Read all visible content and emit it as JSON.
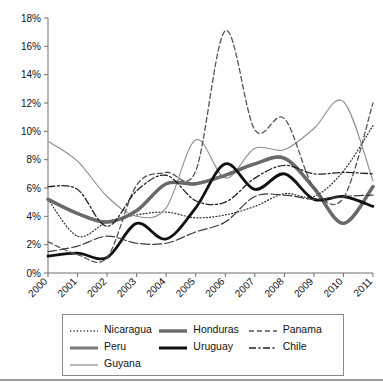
{
  "chart_data": {
    "type": "line",
    "title": "",
    "subtitle": "",
    "xlabel": "",
    "ylabel": "",
    "x": [
      2000,
      2001,
      2002,
      2003,
      2004,
      2005,
      2006,
      2007,
      2008,
      2009,
      2010,
      2011
    ],
    "categories": [
      "2000",
      "2001",
      "2002",
      "2003",
      "2004",
      "2005",
      "2006",
      "2007",
      "2008",
      "2009",
      "2010",
      "2011"
    ],
    "xlim": [
      2000,
      2011
    ],
    "ylim": [
      0,
      18
    ],
    "ytick_values": [
      0,
      2,
      4,
      6,
      8,
      10,
      12,
      14,
      16,
      18
    ],
    "ytick_labels": [
      "0%",
      "2%",
      "4%",
      "6%",
      "8%",
      "10%",
      "12%",
      "14%",
      "16%",
      "18%"
    ],
    "grid": false,
    "legend_position": "bottom",
    "value_unit": "percent",
    "series": [
      {
        "name": "Nicaragua",
        "style": "dotted",
        "color": "#2b2b2b",
        "width": 1.2,
        "dash": "1,2.2",
        "values": [
          5.2,
          2.6,
          3.6,
          4.1,
          4.3,
          3.9,
          4.1,
          4.7,
          5.6,
          5.4,
          7.2,
          10.4
        ]
      },
      {
        "name": "Peru",
        "style": "solid",
        "color": "#7a7a7a",
        "width": 3.0,
        "dash": "",
        "values": [
          5.2,
          4.2,
          3.6,
          4.4,
          6.3,
          6.3,
          6.9,
          7.7,
          8.1,
          6.0,
          3.5,
          6.1
        ]
      },
      {
        "name": "Guyana",
        "style": "solid",
        "color": "#8d8d8d",
        "width": 1.1,
        "dash": "",
        "values": [
          9.3,
          7.9,
          5.4,
          4.0,
          4.6,
          9.4,
          6.7,
          8.8,
          8.7,
          10.2,
          12.1,
          6.5
        ]
      },
      {
        "name": "Honduras",
        "style": "solid",
        "color": "#6a6a6a",
        "width": 3.4,
        "dash": "",
        "values": [
          5.2,
          4.2,
          3.6,
          4.4,
          6.3,
          6.3,
          6.9,
          7.7,
          8.1,
          6.0,
          3.5,
          6.1
        ]
      },
      {
        "name": "Uruguay",
        "style": "solid",
        "color": "#111111",
        "width": 2.8,
        "dash": "",
        "values": [
          1.2,
          1.4,
          1.1,
          3.5,
          2.4,
          4.6,
          7.7,
          5.9,
          7.0,
          5.2,
          5.4,
          4.7
        ]
      },
      {
        "name": "Panama",
        "style": "dashed",
        "color": "#555555",
        "width": 1.3,
        "dash": "5,3",
        "values": [
          2.2,
          1.3,
          1.1,
          6.2,
          7.1,
          7.2,
          17.1,
          10.1,
          10.9,
          6.0,
          5.3,
          12.0
        ]
      },
      {
        "name": "Chile",
        "style": "dashdot",
        "color": "#222222",
        "width": 1.3,
        "dash": "7,2.5,2,2.5",
        "values": [
          6.1,
          5.9,
          3.3,
          5.8,
          6.9,
          5.1,
          5.0,
          6.7,
          7.6,
          7.0,
          7.1,
          7.0
        ]
      },
      {
        "name": "unlabeled-lower",
        "style": "dashed-long",
        "color": "#3a3a3a",
        "width": 1.2,
        "dash": "9,3",
        "values": [
          1.5,
          1.9,
          2.6,
          2.1,
          2.1,
          2.9,
          3.6,
          5.4,
          5.5,
          5.2,
          5.4,
          5.5
        ]
      }
    ]
  },
  "axes": {
    "y_ticks": [
      "18%",
      "16%",
      "14%",
      "12%",
      "10%",
      "8%",
      "6%",
      "4%",
      "2%",
      "0%"
    ],
    "x_ticks": [
      "2000",
      "2001",
      "2002",
      "2003",
      "2004",
      "2005",
      "2006",
      "2007",
      "2008",
      "2009",
      "2010",
      "2011"
    ]
  },
  "legend": {
    "items": [
      {
        "label": "Nicaragua",
        "sample": "dotted-thin-dark"
      },
      {
        "label": "Honduras",
        "sample": "solid-thick-gray"
      },
      {
        "label": "Panama",
        "sample": "dashed-gray"
      },
      {
        "label": "Peru",
        "sample": "solid-medium-gray"
      },
      {
        "label": "Uruguay",
        "sample": "solid-thick-black"
      },
      {
        "label": "Chile",
        "sample": "dashdot-black"
      },
      {
        "label": "Guyana",
        "sample": "solid-thin-gray"
      }
    ]
  }
}
